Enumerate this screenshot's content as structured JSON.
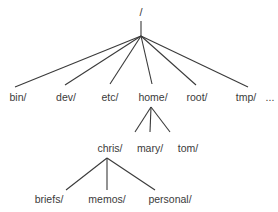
{
  "diagram": {
    "type": "directory-tree",
    "line_color": "#3a3a3a",
    "text_color": "#3a3a3a",
    "root": {
      "label": "/",
      "x": 141,
      "y": 16,
      "stem_top": 21,
      "junction": [
        141,
        36
      ]
    },
    "level1": {
      "label_y": 101,
      "items": [
        {
          "label": "bin/",
          "x": 18,
          "end": [
            15,
            87
          ]
        },
        {
          "label": "dev/",
          "x": 66,
          "end": [
            65,
            85
          ]
        },
        {
          "label": "etc/",
          "x": 110,
          "end": [
            110,
            84
          ]
        },
        {
          "label": "home/",
          "x": 153,
          "end": [
            152,
            84
          ]
        },
        {
          "label": "root/",
          "x": 197,
          "end": [
            196,
            85
          ]
        },
        {
          "label": "tmp/",
          "x": 246,
          "end": [
            248,
            87
          ]
        }
      ],
      "ellipsis": {
        "label": "...",
        "x": 270
      }
    },
    "home_children": {
      "parent_junction": [
        151,
        107
      ],
      "label_y": 152,
      "items": [
        {
          "label": "chris/",
          "x": 110,
          "end": [
            135,
            132
          ]
        },
        {
          "label": "mary/",
          "x": 150,
          "end": [
            150,
            132
          ]
        },
        {
          "label": "tom/",
          "x": 188,
          "end": [
            170,
            132
          ]
        }
      ]
    },
    "chris_children": {
      "parent_junction": [
        107,
        158
      ],
      "label_y": 203,
      "items": [
        {
          "label": "briefs/",
          "x": 49,
          "end": [
            66,
            190
          ]
        },
        {
          "label": "memos/",
          "x": 107,
          "end": [
            107,
            190
          ]
        },
        {
          "label": "personal/",
          "x": 170,
          "end": [
            155,
            190
          ]
        }
      ]
    }
  }
}
